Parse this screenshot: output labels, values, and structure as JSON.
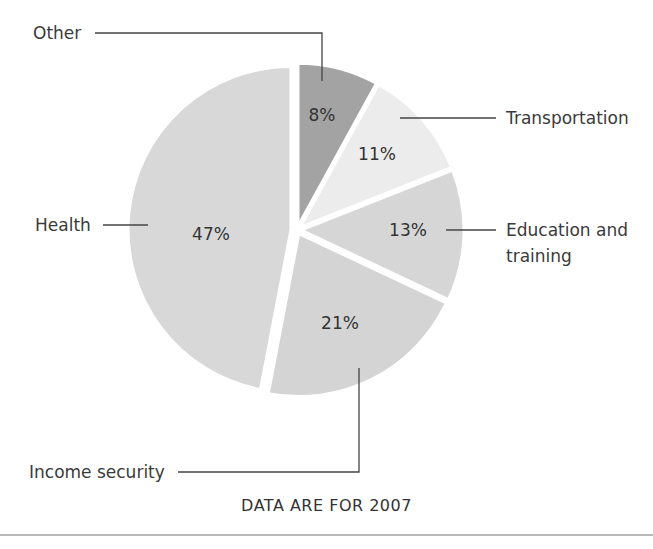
{
  "chart_data": {
    "type": "pie",
    "title": "",
    "caption": "DATA ARE FOR 2007",
    "start_angle_deg": 0,
    "direction": "clockwise",
    "categories": [
      "Other",
      "Transportation",
      "Education and training",
      "Income security",
      "Health"
    ],
    "values": [
      8,
      11,
      13,
      21,
      47
    ],
    "value_labels": [
      "8%",
      "11%",
      "13%",
      "21%",
      "47%"
    ],
    "colors": [
      "#a3a3a3",
      "#ececec",
      "#d6d6d6",
      "#d4d4d4",
      "#d8d8d8"
    ],
    "legend": "leader-line labels"
  },
  "labels": {
    "other": "Other",
    "transportation": "Transportation",
    "education_line1": "Education and",
    "education_line2": "training",
    "health": "Health",
    "income": "Income security"
  },
  "footer": "DATA ARE FOR 2007"
}
